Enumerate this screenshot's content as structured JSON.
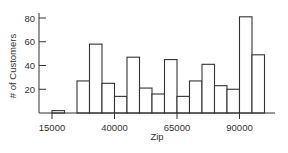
{
  "chart_data": {
    "type": "bar",
    "subtype": "histogram",
    "title": "",
    "xlabel": "Zip",
    "ylabel": "# of Customers",
    "bin_width": 5000,
    "bin_edges": [
      15000,
      20000,
      25000,
      30000,
      35000,
      40000,
      45000,
      50000,
      55000,
      60000,
      65000,
      70000,
      75000,
      80000,
      85000,
      90000,
      95000,
      100000
    ],
    "categories": [
      "15000-20000",
      "20000-25000",
      "25000-30000",
      "30000-35000",
      "35000-40000",
      "40000-45000",
      "45000-50000",
      "50000-55000",
      "55000-60000",
      "60000-65000",
      "65000-70000",
      "70000-75000",
      "75000-80000",
      "80000-85000",
      "85000-90000",
      "90000-95000",
      "95000-100000"
    ],
    "values": [
      2,
      0,
      27,
      58,
      25,
      14,
      47,
      21,
      16,
      45,
      14,
      27,
      41,
      23,
      20,
      81,
      49
    ],
    "xticks": [
      15000,
      40000,
      65000,
      90000
    ],
    "xtick_labels": [
      "15000",
      "40000",
      "65000",
      "90000"
    ],
    "yticks": [
      20,
      40,
      60,
      80
    ],
    "ytick_labels": [
      "20",
      "40",
      "60",
      "80"
    ],
    "xlim": [
      10000,
      102000
    ],
    "ylim": [
      0,
      90
    ],
    "grid": false,
    "legend": null,
    "colors": {
      "bar_fill": "#ffffff",
      "bar_stroke": "#333333",
      "axis": "#333333"
    }
  }
}
